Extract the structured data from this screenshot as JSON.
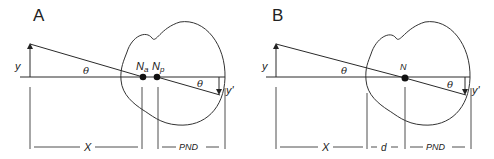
{
  "figure": {
    "panels": [
      {
        "id": "A",
        "label": "A",
        "object_label": "y",
        "image_label": "y'",
        "angle_label_object": "θ",
        "angle_label_image": "θ",
        "nodal_points": [
          {
            "label_main": "N",
            "label_sub": "a"
          },
          {
            "label_main": "N",
            "label_sub": "p"
          }
        ],
        "dimensions": {
          "object_distance": "X",
          "posterior_nodal_distance": "PND"
        }
      },
      {
        "id": "B",
        "label": "B",
        "object_label": "y",
        "image_label": "y'",
        "angle_label_object": "θ",
        "angle_label_image": "θ",
        "nodal_points": [
          {
            "label_main": "N",
            "label_sub": ""
          }
        ],
        "dimensions": {
          "object_distance": "X",
          "cornea_to_nodal": "d",
          "posterior_nodal_distance": "PND"
        }
      }
    ],
    "colors": {
      "ink": "#222222",
      "background": "#ffffff"
    }
  }
}
